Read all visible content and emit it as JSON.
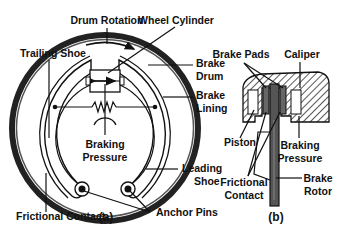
{
  "figure_a": {
    "caption": "(a)",
    "labels": {
      "drum_rotation": "Drum Rotation",
      "wheel_cylinder": "Wheel Cylinder",
      "trailing_shoe": "Trailing Shoe",
      "brake_drum_1": "Brake",
      "brake_drum_2": "Drum",
      "brake_lining_1": "Brake",
      "brake_lining_2": "Lining",
      "braking_pressure_1": "Braking",
      "braking_pressure_2": "Pressure",
      "leading_shoe_1": "Leading",
      "leading_shoe_2": "Shoe",
      "frictional_contact": "Frictional Contact",
      "anchor_pins": "Anchor Pins"
    }
  },
  "figure_b": {
    "caption": "(b)",
    "labels": {
      "brake_pads": "Brake Pads",
      "caliper": "Caliper",
      "piston": "Piston",
      "braking_pressure_1": "Braking",
      "braking_pressure_2": "Pressure",
      "frictional_contact_1": "Frictional",
      "frictional_contact_2": "Contact",
      "brake_rotor_1": "Brake",
      "brake_rotor_2": "Rotor"
    }
  },
  "colors": {
    "ink": "#111111",
    "drum_gray": "#555555",
    "pad_gray": "#666666"
  }
}
